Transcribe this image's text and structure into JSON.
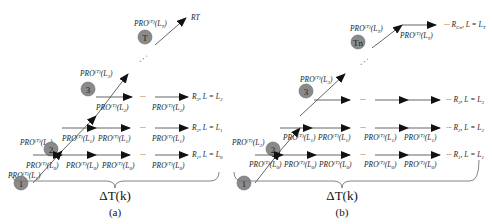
{
  "figure": {
    "panel_a": {
      "caption": "(a)",
      "brace_label": "ΔT(k)",
      "nodes": [
        {
          "id": "1",
          "label": "1"
        },
        {
          "id": "2",
          "label": "2"
        },
        {
          "id": "3",
          "label": "3"
        },
        {
          "id": "T",
          "label": "T"
        }
      ],
      "diag_labels": [
        {
          "pre": "PRO",
          "sup": "(T)",
          "arg": "L",
          "sub": "1"
        },
        {
          "pre": "PRO",
          "sup": "(T)",
          "arg": "L",
          "sub": "2"
        },
        {
          "pre": "PRO",
          "sup": "(T)",
          "arg": "L",
          "sub": "3"
        },
        {
          "pre": "PRO",
          "sup": "(T)",
          "arg": "L",
          "sub": "T"
        }
      ],
      "rows": [
        {
          "labels": [
            "PRO(T)(L0)",
            "PRO(T)(L0)",
            "PRO(T)(L0)",
            "PRO(T)(L0)"
          ],
          "end": "R1, L = L0"
        },
        {
          "labels": [
            "PRO(T)(L1)",
            "PRO(T)(L1)",
            "PRO(T)(L1)"
          ],
          "end": "R2, L = L1"
        },
        {
          "labels": [
            "PRO(T)(L2)",
            "PRO(T)(L2)"
          ],
          "end": "R3, L = L2"
        }
      ],
      "top_end": "RT",
      "ellipsis": "···",
      "dots": "⋰"
    },
    "panel_b": {
      "caption": "(b)",
      "brace_label": "ΔT(k)",
      "nodes": [
        {
          "id": "1",
          "label": "1"
        },
        {
          "id": "2",
          "label": "2"
        },
        {
          "id": "3",
          "label": "3"
        },
        {
          "id": "Tn",
          "label": "Tn"
        }
      ],
      "rows": [
        {
          "labels": [
            "PRO(T)(L0)",
            "PRO(T)(L0)",
            "PRO(T)(L0)",
            "PRO(T)(L0)",
            "PRO(T)(L0)"
          ],
          "end": "R1, L = L1"
        },
        {
          "labels": [
            "PRO(T)(L1)",
            "PRO(T)(L1)",
            "PRO(T)(L1)",
            "PRO(T)(L1)"
          ],
          "end": "R2, L = L2"
        },
        {
          "labels": [
            "PRO(T)(L2)",
            "PRO(T)(L2)",
            "PRO(T)(L2)"
          ],
          "end": "R3, L = L3"
        }
      ],
      "top_row": {
        "labels": [
          "PRO(T)(LT)"
        ],
        "end": "RCn, L = LT"
      },
      "ellipsis": "···",
      "dots": "⋰"
    }
  }
}
